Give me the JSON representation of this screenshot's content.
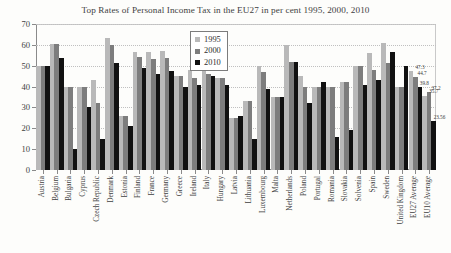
{
  "chart_data": {
    "type": "bar",
    "title": "Top Rates of Personal Income Tax in the EU27 in per cent 1995, 2000, 2010",
    "xlabel": "",
    "ylabel": "",
    "ylim": [
      0,
      70
    ],
    "yticks": [
      0,
      10,
      20,
      30,
      40,
      50,
      60,
      70
    ],
    "grid": true,
    "legend_position": "top-center",
    "categories": [
      "Austria",
      "Belgium",
      "Bulgaria",
      "Cyprus",
      "Czech Republic",
      "Denmark",
      "Estonia",
      "Finland",
      "France",
      "Germany",
      "Greece",
      "Ireland",
      "Italy",
      "Hungary",
      "Latvia",
      "Lithuania",
      "Luxembourg",
      "Malta",
      "Netherlands",
      "Poland",
      "Portugal",
      "Romania",
      "Slovakia",
      "Solvenia",
      "Spain",
      "Sweden",
      "United Kingdom",
      "EU27 Average",
      "EU10 Average"
    ],
    "series": [
      {
        "name": "1995",
        "color": "#b9b9b9",
        "values": [
          50,
          60.6,
          40,
          40,
          43,
          63.5,
          26,
          56.6,
          56.8,
          57,
          45,
          48,
          51,
          44,
          25,
          33,
          50,
          35,
          60,
          45,
          40,
          40,
          42,
          50,
          56,
          61,
          40,
          47.3,
          35.7
        ]
      },
      {
        "name": "2000",
        "color": "#7d7d7d",
        "values": [
          50,
          60.6,
          40,
          40,
          32,
          59.7,
          26,
          54,
          53.3,
          53.8,
          45,
          44,
          45.9,
          44,
          25,
          33,
          47.2,
          35,
          52,
          40,
          40,
          40,
          42,
          50,
          48,
          51.5,
          40,
          44.7,
          37.2
        ]
      },
      {
        "name": "2010",
        "color": "#111111",
        "values": [
          50,
          53.7,
          10,
          30,
          15,
          51.5,
          21,
          49,
          45.8,
          47.5,
          40,
          41,
          45.2,
          40.6,
          26,
          15,
          39,
          35,
          52,
          32,
          42,
          16,
          19,
          41,
          43,
          56.4,
          50,
          39.8,
          23.56
        ]
      }
    ],
    "data_labels": [
      {
        "text": "47.3",
        "category": "EU27 Average",
        "series": "1995"
      },
      {
        "text": "44.7",
        "category": "EU27 Average",
        "series": "2000"
      },
      {
        "text": "39.8",
        "category": "EU27 Average",
        "series": "2010"
      },
      {
        "text": "35.7",
        "category": "EU10 Average",
        "series": "1995"
      },
      {
        "text": "37.2",
        "category": "EU10 Average",
        "series": "2000"
      },
      {
        "text": "23.56",
        "category": "EU10 Average",
        "series": "2010"
      }
    ]
  }
}
